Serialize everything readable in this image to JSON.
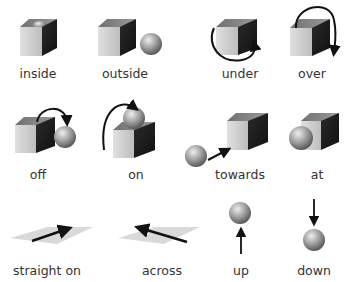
{
  "items": [
    {
      "label": "inside"
    },
    {
      "label": "outside"
    },
    {
      "label": "under"
    },
    {
      "label": "over"
    },
    {
      "label": "off"
    },
    {
      "label": "on"
    },
    {
      "label": "towards"
    },
    {
      "label": "at"
    },
    {
      "label": "straight on"
    },
    {
      "label": "across"
    },
    {
      "label": "up"
    },
    {
      "label": "down"
    }
  ],
  "colors": {
    "cube_front": "#c8c8c8",
    "cube_top": "#8a8a8a",
    "cube_side": "#1e1e1e",
    "sphere": "#9a9a9a",
    "arrow": "#111111",
    "plane": "#d9d9d9",
    "text": "#333333"
  }
}
